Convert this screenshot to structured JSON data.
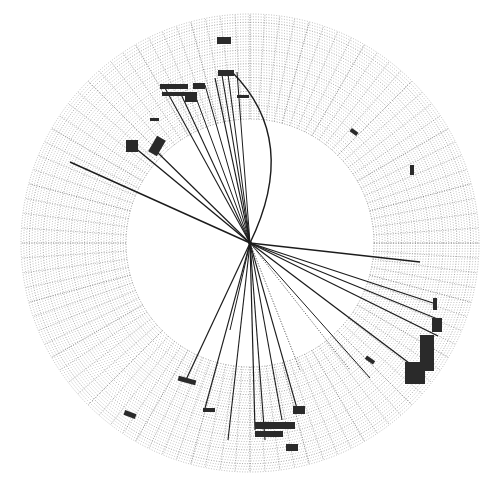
{
  "diagram": {
    "type": "event-display",
    "background": "#ffffff",
    "ink": "#1c1c1c",
    "grid_color": "#6b6b6b",
    "center": [
      250,
      243
    ],
    "detector": {
      "outer_radius": 229,
      "inner_radius": 124,
      "rings": 38,
      "spokes": 96
    },
    "vertex": [
      250,
      243
    ],
    "tracks": [
      {
        "type": "line",
        "to": [
          70,
          162
        ],
        "w": 1.4
      },
      {
        "type": "line",
        "to": [
          128,
          142
        ],
        "w": 1.4
      },
      {
        "type": "line",
        "to": [
          155,
          150
        ],
        "w": 1.2
      },
      {
        "type": "line",
        "to": [
          165,
          88
        ],
        "w": 1.1
      },
      {
        "type": "line",
        "to": [
          180,
          92
        ],
        "w": 1.1
      },
      {
        "type": "line",
        "to": [
          195,
          95
        ],
        "w": 1.0
      },
      {
        "type": "line",
        "to": [
          205,
          85
        ],
        "w": 1.0
      },
      {
        "type": "line",
        "to": [
          215,
          78
        ],
        "w": 1.2
      },
      {
        "type": "line",
        "to": [
          222,
          75
        ],
        "w": 1.1
      },
      {
        "type": "line",
        "to": [
          228,
          74
        ],
        "w": 1.0
      },
      {
        "type": "line",
        "to": [
          237,
          72
        ],
        "w": 1.0
      },
      {
        "type": "curve",
        "ctrl": [
          300,
          140
        ],
        "to": [
          232,
          72
        ],
        "w": 1.4
      },
      {
        "type": "line",
        "to": [
          420,
          262
        ],
        "w": 1.3
      },
      {
        "type": "line",
        "to": [
          433,
          303
        ],
        "w": 1.2
      },
      {
        "type": "line",
        "to": [
          440,
          320
        ],
        "w": 1.2
      },
      {
        "type": "line",
        "to": [
          438,
          336
        ],
        "w": 1.2
      },
      {
        "type": "line",
        "to": [
          425,
          375
        ],
        "w": 1.3
      },
      {
        "type": "line",
        "to": [
          350,
          370
        ],
        "w": 0.7,
        "dotted": true
      },
      {
        "type": "line",
        "to": [
          370,
          378
        ],
        "w": 1.0
      },
      {
        "type": "line",
        "to": [
          185,
          382
        ],
        "w": 1.2
      },
      {
        "type": "line",
        "to": [
          205,
          408
        ],
        "w": 1.1
      },
      {
        "type": "line",
        "to": [
          228,
          440
        ],
        "w": 1.1
      },
      {
        "type": "line",
        "to": [
          255,
          430
        ],
        "w": 1.2
      },
      {
        "type": "line",
        "to": [
          265,
          440
        ],
        "w": 1.1
      },
      {
        "type": "line",
        "to": [
          282,
          420
        ],
        "w": 1.1
      },
      {
        "type": "line",
        "to": [
          298,
          412
        ],
        "w": 1.1
      },
      {
        "type": "line",
        "to": [
          300,
          370
        ],
        "w": 0.7,
        "dotted": true
      },
      {
        "type": "line",
        "to": [
          230,
          330
        ],
        "w": 1.0
      }
    ],
    "hits": [
      {
        "x": 217,
        "y": 37,
        "w": 14,
        "h": 7
      },
      {
        "x": 218,
        "y": 70,
        "w": 16,
        "h": 6
      },
      {
        "x": 160,
        "y": 84,
        "w": 28,
        "h": 5
      },
      {
        "x": 162,
        "y": 92,
        "w": 24,
        "h": 4
      },
      {
        "x": 185,
        "y": 92,
        "w": 12,
        "h": 10
      },
      {
        "x": 193,
        "y": 83,
        "w": 12,
        "h": 6
      },
      {
        "x": 237,
        "y": 95,
        "w": 12,
        "h": 3
      },
      {
        "x": 150,
        "y": 118,
        "w": 9,
        "h": 3
      },
      {
        "x": 126,
        "y": 140,
        "w": 12,
        "h": 12
      },
      {
        "x": 152,
        "y": 137,
        "w": 10,
        "h": 18,
        "rot": 30
      },
      {
        "x": 350,
        "y": 130,
        "w": 8,
        "h": 4,
        "rot": 35
      },
      {
        "x": 410,
        "y": 165,
        "w": 4,
        "h": 10
      },
      {
        "x": 433,
        "y": 298,
        "w": 4,
        "h": 12
      },
      {
        "x": 432,
        "y": 318,
        "w": 10,
        "h": 14
      },
      {
        "x": 420,
        "y": 335,
        "w": 14,
        "h": 36
      },
      {
        "x": 405,
        "y": 362,
        "w": 20,
        "h": 22
      },
      {
        "x": 365,
        "y": 358,
        "w": 10,
        "h": 4,
        "rot": 35
      },
      {
        "x": 178,
        "y": 378,
        "w": 18,
        "h": 5,
        "rot": 15
      },
      {
        "x": 203,
        "y": 408,
        "w": 12,
        "h": 4
      },
      {
        "x": 124,
        "y": 412,
        "w": 12,
        "h": 5,
        "rot": 20
      },
      {
        "x": 293,
        "y": 406,
        "w": 12,
        "h": 8
      },
      {
        "x": 255,
        "y": 422,
        "w": 40,
        "h": 7
      },
      {
        "x": 255,
        "y": 431,
        "w": 28,
        "h": 6
      },
      {
        "x": 286,
        "y": 444,
        "w": 12,
        "h": 7
      }
    ]
  }
}
